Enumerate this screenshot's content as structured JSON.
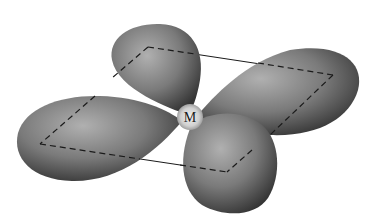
{
  "diagram": {
    "type": "d-orbital lobes with square plane",
    "center_label": "M",
    "lobe_count": 4,
    "colors": {
      "background": "#ffffff",
      "lobe_light": "#a8a8a8",
      "lobe_dark": "#3a3a3a",
      "center_glow": "#e8e8e8",
      "line": "#1a1a1a"
    },
    "square_corners": [
      [
        148,
        47
      ],
      [
        333,
        75
      ],
      [
        227,
        172
      ],
      [
        40,
        144
      ]
    ]
  }
}
